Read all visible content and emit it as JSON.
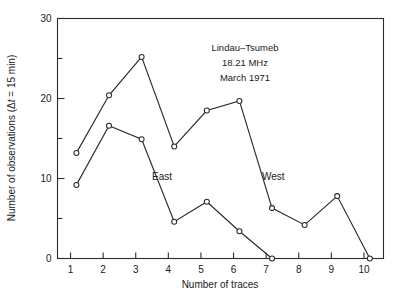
{
  "chart_data": {
    "type": "line",
    "title": "",
    "xlabel": "Number of traces",
    "ylabel": "Number of observations (Δt = 15 min)",
    "ylabel_parts": {
      "main": "Number of observations (",
      "delta": "Δ",
      "italic_t": "t",
      "tail": " = 15 min)"
    },
    "x": [
      1,
      2,
      3,
      4,
      5,
      6,
      7,
      8,
      9,
      10
    ],
    "xlim": [
      0.6,
      10.6
    ],
    "ylim": [
      0,
      30
    ],
    "xticks": [
      "1",
      "2",
      "3",
      "4",
      "5",
      "6",
      "7",
      "8",
      "9",
      "10"
    ],
    "yticks_major": [
      "0",
      "10",
      "20",
      "30"
    ],
    "yticks_major_values": [
      0,
      10,
      20,
      30
    ],
    "yticks_minor_values": [
      5,
      15,
      25
    ],
    "grid": false,
    "legend_position": "inline-annotation",
    "marker": "open-circle",
    "series": [
      {
        "name": "West",
        "label": "West",
        "x": [
          1,
          2,
          3,
          4,
          5,
          6,
          7,
          8,
          9,
          10
        ],
        "values": [
          13.2,
          20.4,
          25.2,
          14.0,
          18.5,
          19.7,
          6.3,
          4.2,
          7.8,
          0.0
        ]
      },
      {
        "name": "East",
        "label": "East",
        "x": [
          1,
          2,
          3,
          4,
          5,
          6,
          7
        ],
        "values": [
          9.2,
          16.6,
          14.9,
          4.6,
          7.1,
          3.4,
          0.0
        ]
      }
    ],
    "annotations": [
      {
        "name": "station-pair",
        "text": "Lindau–Tsumeb"
      },
      {
        "name": "frequency",
        "text": "18.21 MHz"
      },
      {
        "name": "date",
        "text": "March 1971"
      }
    ],
    "series_labels": [
      {
        "name": "east-label",
        "text": "East"
      },
      {
        "name": "west-label",
        "text": "West"
      }
    ],
    "colors": {
      "line": "#2b2b2b",
      "marker_fill": "#ffffff",
      "text": "#1a1a1a",
      "background": "#ffffff"
    }
  }
}
